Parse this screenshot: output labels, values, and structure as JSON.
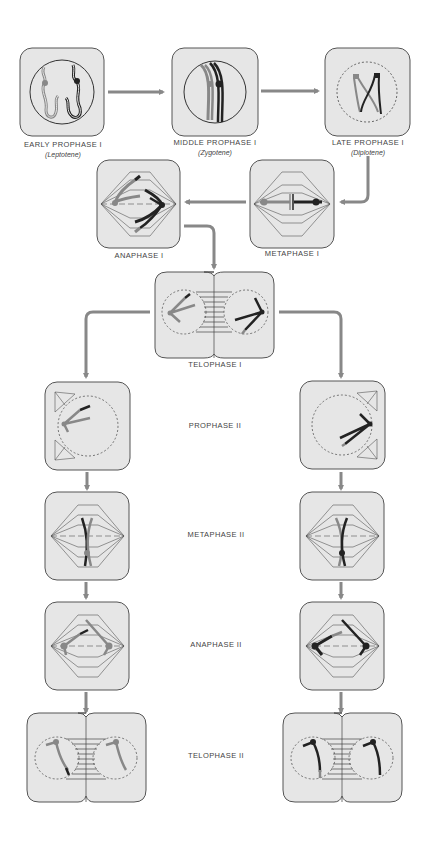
{
  "colors": {
    "cell_fill": "#e6e6e6",
    "cell_stroke": "#555555",
    "arrow": "#888888",
    "chromosome_light": "#8a8a8a",
    "chromosome_dark": "#222222",
    "spindle": "#555555"
  },
  "stages": {
    "early_prophase_1": {
      "label": "EARLY PROPHASE I",
      "sublabel": "(Leptotene)"
    },
    "middle_prophase_1": {
      "label": "MIDDLE PROPHASE I",
      "sublabel": "(Zygotene)"
    },
    "late_prophase_1": {
      "label": "LATE PROPHASE I",
      "sublabel": "(Diplotene)"
    },
    "metaphase_1": {
      "label": "METAPHASE I"
    },
    "anaphase_1": {
      "label": "ANAPHASE I"
    },
    "telophase_1": {
      "label": "TELOPHASE I"
    },
    "prophase_2": {
      "label": "PROPHASE II"
    },
    "metaphase_2": {
      "label": "METAPHASE II"
    },
    "anaphase_2": {
      "label": "ANAPHASE II"
    },
    "telophase_2": {
      "label": "TELOPHASE II"
    }
  },
  "flow": [
    "early_prophase_1 -> middle_prophase_1",
    "middle_prophase_1 -> late_prophase_1",
    "late_prophase_1 -> metaphase_1",
    "metaphase_1 -> anaphase_1",
    "anaphase_1 -> telophase_1",
    "telophase_1 -> prophase_2 (left, right)",
    "prophase_2 -> metaphase_2",
    "metaphase_2 -> anaphase_2",
    "anaphase_2 -> telophase_2"
  ]
}
